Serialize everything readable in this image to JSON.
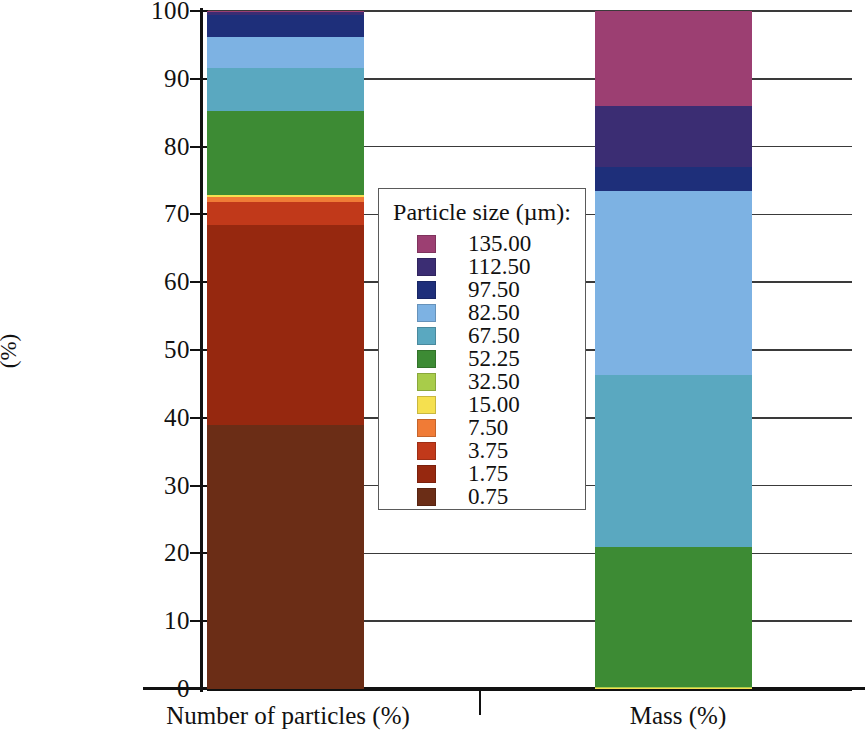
{
  "chart_data": {
    "type": "bar",
    "subtype": "stacked-100-percent",
    "title": "",
    "xlabel": "",
    "ylabel": "(%)",
    "ylim": [
      0,
      100
    ],
    "yticks": [
      0,
      10,
      20,
      30,
      40,
      50,
      60,
      70,
      80,
      90,
      100
    ],
    "ytick_labels": [
      "0",
      "10",
      "20",
      "30",
      "40",
      "50",
      "60",
      "70",
      "80",
      "90",
      "100"
    ],
    "grid": true,
    "grid_axis": "y",
    "legend_title": "Particle size (µm):",
    "legend_position": "center",
    "categories": [
      "Number of particles (%)",
      "Mass (%)"
    ],
    "series": [
      {
        "name": "0.75",
        "color": "#6b2d16",
        "values": [
          39.0,
          0.0
        ]
      },
      {
        "name": "1.75",
        "color": "#96280f",
        "values": [
          29.5,
          0.0
        ]
      },
      {
        "name": "3.75",
        "color": "#c1391a",
        "values": [
          3.3,
          0.0
        ]
      },
      {
        "name": "7.50",
        "color": "#f07b36",
        "values": [
          0.7,
          0.0
        ]
      },
      {
        "name": "15.00",
        "color": "#f5e04f",
        "values": [
          0.3,
          0.15
        ]
      },
      {
        "name": "32.50",
        "color": "#a8cc4a",
        "values": [
          0.1,
          0.15
        ]
      },
      {
        "name": "52.25",
        "color": "#3d8b34",
        "values": [
          12.4,
          20.7
        ]
      },
      {
        "name": "67.50",
        "color": "#5aa8c0",
        "values": [
          6.3,
          25.3
        ]
      },
      {
        "name": "82.50",
        "color": "#7db2e3",
        "values": [
          4.6,
          27.2
        ]
      },
      {
        "name": "97.50",
        "color": "#1e2f7a",
        "values": [
          3.2,
          3.5
        ]
      },
      {
        "name": "112.50",
        "color": "#3b2d73",
        "values": [
          0.4,
          9.0
        ]
      },
      {
        "name": "135.00",
        "color": "#9c3f72",
        "values": [
          0.2,
          14.0
        ]
      }
    ],
    "legend_entries": [
      {
        "label": "135.00",
        "color": "#9c3f72"
      },
      {
        "label": "112.50",
        "color": "#3b2d73"
      },
      {
        "label": "97.50",
        "color": "#1e2f7a"
      },
      {
        "label": "82.50",
        "color": "#7db2e3"
      },
      {
        "label": "67.50",
        "color": "#5aa8c0"
      },
      {
        "label": "52.25",
        "color": "#3d8b34"
      },
      {
        "label": "32.50",
        "color": "#a8cc4a"
      },
      {
        "label": "15.00",
        "color": "#f5e04f"
      },
      {
        "label": "7.50",
        "color": "#f07b36"
      },
      {
        "label": "3.75",
        "color": "#c1391a"
      },
      {
        "label": "1.75",
        "color": "#96280f"
      },
      {
        "label": "0.75",
        "color": "#6b2d16"
      }
    ]
  }
}
